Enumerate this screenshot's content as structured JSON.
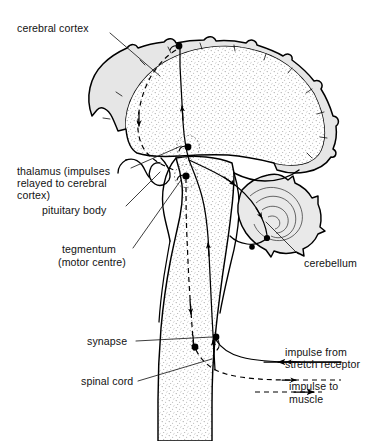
{
  "figure": {
    "ink_color": "#000000",
    "cortex_band_color": "#e6e6e6",
    "white_matter_color": "#fbfbfb",
    "background_color": "#ffffff"
  },
  "labels": {
    "cerebral_cortex": "cerebral cortex",
    "thalamus_line1": "thalamus (impulses",
    "thalamus_line2": "relayed to cerebral",
    "thalamus_line3": "cortex)",
    "pituitary_body": "pituitary body",
    "tegmentum_line1": "tegmentum",
    "tegmentum_line2": "(motor centre)",
    "synapse": "synapse",
    "spinal_cord": "spinal cord",
    "cerebellum": "cerebellum"
  },
  "legend": {
    "items": [
      {
        "id": "impulse-from-stretch-receptor",
        "line1": "impulse from",
        "line2": "stretch receptor",
        "line_style": "solid",
        "arrow_direction": "left"
      },
      {
        "id": "impulse-to-muscle",
        "line1": "impulse to",
        "line2": "muscle",
        "line_style": "dashed",
        "arrow_direction": "right"
      }
    ]
  },
  "structures": [
    {
      "id": "cerebrum",
      "name": "cerebrum"
    },
    {
      "id": "cerebral-cortex",
      "name": "cerebral cortex"
    },
    {
      "id": "cerebellum",
      "name": "cerebellum"
    },
    {
      "id": "thalamus",
      "name": "thalamus"
    },
    {
      "id": "pituitary-body",
      "name": "pituitary body"
    },
    {
      "id": "tegmentum",
      "name": "tegmentum"
    },
    {
      "id": "brainstem",
      "name": "brainstem"
    },
    {
      "id": "spinal-cord",
      "name": "spinal cord"
    }
  ],
  "synapse_points": [
    {
      "id": "cortex-synapse",
      "location": "cerebral cortex"
    },
    {
      "id": "thalamus-synapse",
      "location": "thalamus"
    },
    {
      "id": "tegmentum-synapse",
      "location": "tegmentum"
    },
    {
      "id": "spinal-synapse-sensory",
      "location": "spinal cord"
    },
    {
      "id": "spinal-synapse-motor",
      "location": "spinal cord"
    }
  ]
}
